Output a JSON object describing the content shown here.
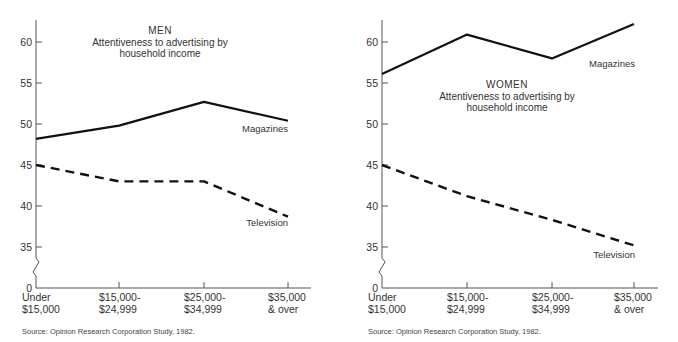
{
  "chart_data": [
    {
      "type": "line",
      "panel": "left",
      "title": "MEN",
      "subtitle": "Attentiveness to advertising by household income",
      "xlabel": "",
      "ylabel": "",
      "categories": [
        "Under $15,000",
        "$15,000-$24,999",
        "$25,000-$34,999",
        "$35,000 & over"
      ],
      "category_lines": [
        [
          "Under",
          "$15,000"
        ],
        [
          "$15,000-",
          "$24,999"
        ],
        [
          "$25,000-",
          "$34,999"
        ],
        [
          "$35,000",
          "& over"
        ]
      ],
      "yticks": [
        0,
        35,
        40,
        45,
        50,
        55,
        60
      ],
      "ylim": [
        33,
        62.5
      ],
      "axis_break": true,
      "grid": false,
      "series": [
        {
          "name": "Magazines",
          "style": "solid",
          "values": [
            48.2,
            49.8,
            52.7,
            50.4
          ]
        },
        {
          "name": "Television",
          "style": "dashed",
          "values": [
            45.0,
            43.0,
            43.0,
            38.7
          ]
        }
      ],
      "source": "Source:  Opinion Research Corporation Study, 1982."
    },
    {
      "type": "line",
      "panel": "right",
      "title": "WOMEN",
      "subtitle": "Attentiveness to advertising by household income",
      "xlabel": "",
      "ylabel": "",
      "categories": [
        "Under $15,000",
        "$15,000-$24,999",
        "$25,000-$34,999",
        "$35,000 & over"
      ],
      "category_lines": [
        [
          "Under",
          "$15,000"
        ],
        [
          "$15,000-",
          "$24,999"
        ],
        [
          "$25,000-",
          "$34,999"
        ],
        [
          "$35,000",
          "& over"
        ]
      ],
      "yticks": [
        0,
        35,
        40,
        45,
        50,
        55,
        60
      ],
      "ylim": [
        33,
        62.5
      ],
      "axis_break": true,
      "grid": false,
      "series": [
        {
          "name": "Magazines",
          "style": "solid",
          "values": [
            56.1,
            60.9,
            58.0,
            62.2
          ]
        },
        {
          "name": "Television",
          "style": "dashed",
          "values": [
            45.0,
            41.2,
            38.3,
            35.2
          ]
        }
      ],
      "source": "Source:  Opinion Research Corporation Study, 1982."
    }
  ],
  "panels": {
    "left": {
      "title": "MEN",
      "subtitle_line1": "Attentiveness to advertising by",
      "subtitle_line2": "household income",
      "label_magazines": "Magazines",
      "label_television": "Television",
      "source": "Source:  Opinion Research Corporation Study, 1982."
    },
    "right": {
      "title": "WOMEN",
      "subtitle_line1": "Attentiveness to advertising by",
      "subtitle_line2": "household income",
      "label_magazines": "Magazines",
      "label_television": "Television",
      "source": "Source:  Opinion Research Corporation Study, 1982."
    }
  },
  "colors": {
    "line": "#111111",
    "axis": "#555555",
    "text": "#333333"
  }
}
